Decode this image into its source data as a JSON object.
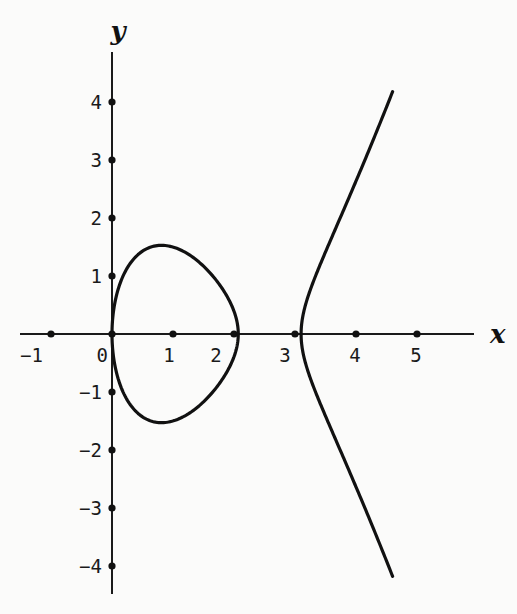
{
  "chart_data": {
    "type": "line",
    "title": "",
    "xlabel": "x",
    "ylabel": "y",
    "equation": "y^2 = x(x - 2.07)(x - 3.1)",
    "roots": [
      0,
      2.07,
      3.1
    ],
    "xlim": [
      -1.4,
      5.9
    ],
    "ylim": [
      -4.4,
      4.8
    ],
    "x_ticks": [
      -1,
      0,
      1,
      2,
      3,
      4,
      5
    ],
    "x_tick_labels": [
      "−1",
      "0",
      "1",
      "2",
      "3",
      "4",
      "5"
    ],
    "y_ticks": [
      -4,
      -3,
      -2,
      -1,
      1,
      2,
      3,
      4
    ],
    "y_tick_labels": [
      "−4",
      "−3",
      "−2",
      "−1",
      "1",
      "2",
      "3",
      "4"
    ],
    "grid": false,
    "legend": null,
    "series": [
      {
        "name": "bounded-loop",
        "x_range": [
          0,
          2.07
        ],
        "note": "closed oval, max y ≈ 1.5 at x ≈ 0.8"
      },
      {
        "name": "unbounded-branch",
        "x_range": [
          3.1,
          4.6
        ],
        "note": "vertex at (3.1, 0), ends near (4.6, ±4.1)"
      }
    ],
    "color": "#111111"
  },
  "plot": {
    "origin_px": [
      112,
      334
    ],
    "x_scale_px": 61,
    "y_scale_px": 58,
    "x_axis_px": [
      20,
      474
    ],
    "y_axis_px": [
      52,
      594
    ],
    "x_label_pos": [
      490,
      343
    ],
    "y_label_pos": [
      118,
      40
    ]
  }
}
